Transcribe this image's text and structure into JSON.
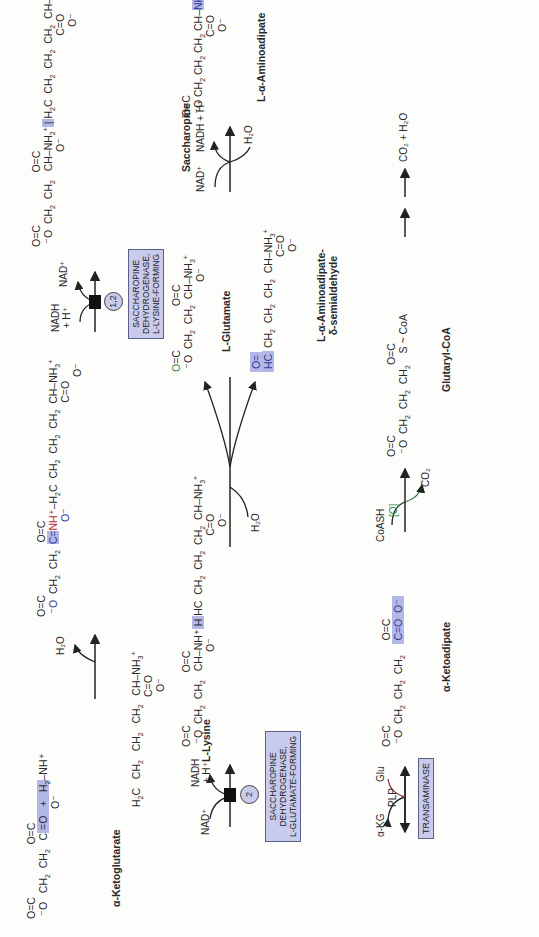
{
  "colors": {
    "highlight": "#b4b8e6",
    "enzyme_box": "#c9cbed",
    "blue_atom": "#2d3a9a",
    "red_atom": "#b0303a",
    "green_atom": "#2f8a4a"
  },
  "compounds": {
    "alpha_ketoglutarate": "α-Ketoglutarate",
    "l_lysine": "L-Lysine",
    "saccharopine": "Saccharopine",
    "l_glutamate": "L-Glutamate",
    "semialdehyde_line1": "L-α-Aminoadipate-",
    "semialdehyde_line2": "δ-semialdehyde",
    "l_aminoadipate": "L-α-Aminoadipate",
    "alpha_ketoadipate": "α-Ketoadipate",
    "glutaryl_coa": "Glutaryl-CoA",
    "final_products": "CO₂ + H₂O"
  },
  "enzymes": {
    "lysine_forming": [
      "SACCHAROPINE",
      "DEHYDROGENASE,",
      "L-LYSINE-FORMING"
    ],
    "lysine_forming_number": "1,2",
    "glutamate_forming": [
      "SACCHAROPINE",
      "DEHYDROGENASE,",
      "L-GLUTAMATE-FORMING"
    ],
    "glutamate_forming_number": "2",
    "transaminase": "TRANSAMINASE"
  },
  "cofactors": {
    "step1_out": "H₂O",
    "step2_in": "NADH",
    "step2_in2": "+ H⁺",
    "step2_out": "NAD⁺",
    "step3_in": "NAD⁺",
    "step3_out": "NADH",
    "step3_out2": "+ H⁺",
    "step3b_in": "H₂O",
    "step4_in": "NAD⁺",
    "step4_in2": "H₂O",
    "step4_out": "NADH + H⁺",
    "trans_in": "α-KG",
    "trans_mid": "PLP",
    "trans_out": "Glu",
    "decarb_in": "CoASH",
    "decarb_mid": "[O]",
    "decarb_out": "CO₂",
    "coa_label": "S ~ CoA"
  }
}
